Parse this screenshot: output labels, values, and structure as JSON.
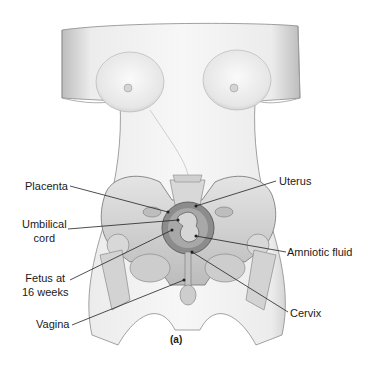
{
  "figure": {
    "caption": "(a)",
    "colors": {
      "skin_light": "#f4f4f4",
      "skin_shade": "#c9c9c9",
      "bone": "#d6d6d6",
      "outline": "#7a7a7a",
      "leader": "#222222",
      "fetus": "#6e6e6e"
    }
  },
  "labels": {
    "left": [
      {
        "id": "placenta",
        "lines": [
          "Placenta"
        ]
      },
      {
        "id": "umbilical-cord",
        "lines": [
          "Umbilical",
          "cord"
        ]
      },
      {
        "id": "fetus",
        "lines": [
          "Fetus at",
          "16 weeks"
        ]
      },
      {
        "id": "vagina",
        "lines": [
          "Vagina"
        ]
      }
    ],
    "right": [
      {
        "id": "uterus",
        "lines": [
          "Uterus"
        ]
      },
      {
        "id": "amniotic-fluid",
        "lines": [
          "Amniotic fluid"
        ]
      },
      {
        "id": "cervix",
        "lines": [
          "Cervix"
        ]
      }
    ]
  }
}
